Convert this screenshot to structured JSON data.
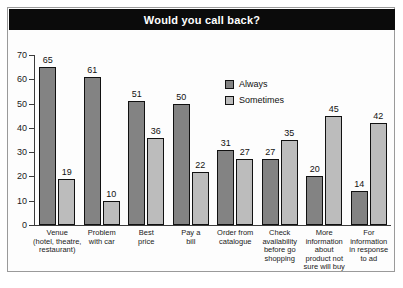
{
  "chart": {
    "title": "Would you call back?"
  },
  "legend": {
    "position": "inside-top-center",
    "entries": [
      {
        "label": "Always",
        "color": "#838383"
      },
      {
        "label": "Sometimes",
        "color": "#bcbcbc"
      }
    ]
  },
  "axis": {
    "y_ticks": [
      "0",
      "10",
      "20",
      "30",
      "40",
      "50",
      "60",
      "70"
    ]
  },
  "chart_data": {
    "type": "bar",
    "title": "Would you call back?",
    "xlabel": "",
    "ylabel": "",
    "ylim": [
      0,
      70
    ],
    "ytick_step": 10,
    "grid": false,
    "legend_position": "inside-top-center",
    "categories": [
      "Venue (hotel, theatre, restaurant)",
      "Problem with car",
      "Best price",
      "Pay a bill",
      "Order from catalogue",
      "Check availability before go shopping",
      "More information about product not sure will buy",
      "For information in response to ad"
    ],
    "category_lines": [
      [
        "Venue",
        "(hotel, theatre,",
        "restaurant)"
      ],
      [
        "Problem",
        "with car"
      ],
      [
        "Best",
        "price"
      ],
      [
        "Pay a",
        "bill"
      ],
      [
        "Order from",
        "catalogue"
      ],
      [
        "Check",
        "availability",
        "before go",
        "shopping"
      ],
      [
        "More",
        "information",
        "about",
        "product not",
        "sure will buy"
      ],
      [
        "For",
        "information",
        "in response",
        "to ad"
      ]
    ],
    "series": [
      {
        "name": "Always",
        "color": "#838383",
        "values": [
          65,
          61,
          51,
          50,
          31,
          27,
          20,
          14
        ]
      },
      {
        "name": "Sometimes",
        "color": "#bcbcbc",
        "values": [
          19,
          10,
          36,
          22,
          27,
          35,
          45,
          42
        ]
      }
    ]
  }
}
